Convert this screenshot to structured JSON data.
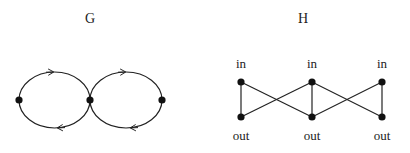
{
  "graph_g": {
    "title": "G",
    "nodes": [
      {
        "id": "g1",
        "x": 19,
        "y": 100
      },
      {
        "id": "g2",
        "x": 90,
        "y": 100
      },
      {
        "id": "g3",
        "x": 162,
        "y": 100
      }
    ],
    "loops": [
      {
        "from": "g1",
        "to": "g2",
        "top_arrow": "right",
        "bottom_arrow": "left"
      },
      {
        "from": "g2",
        "to": "g3",
        "top_arrow": "right",
        "bottom_arrow": "left"
      }
    ]
  },
  "graph_h": {
    "title": "H",
    "top_labels": [
      "in",
      "in",
      "in"
    ],
    "bottom_labels": [
      "out",
      "out",
      "out"
    ],
    "top_nodes": [
      {
        "x": 241,
        "y": 82
      },
      {
        "x": 312,
        "y": 82
      },
      {
        "x": 382,
        "y": 82
      }
    ],
    "bottom_nodes": [
      {
        "x": 241,
        "y": 117
      },
      {
        "x": 312,
        "y": 117
      },
      {
        "x": 382,
        "y": 117
      }
    ],
    "edges": [
      [
        "in1",
        "out1"
      ],
      [
        "in1",
        "out2"
      ],
      [
        "out1",
        "in2"
      ],
      [
        "in2",
        "out2"
      ],
      [
        "in2",
        "out3"
      ],
      [
        "out2",
        "in3"
      ],
      [
        "in3",
        "out3"
      ]
    ]
  },
  "colors": {
    "stroke": "#222222",
    "node": "#111111",
    "background": "#ffffff"
  }
}
